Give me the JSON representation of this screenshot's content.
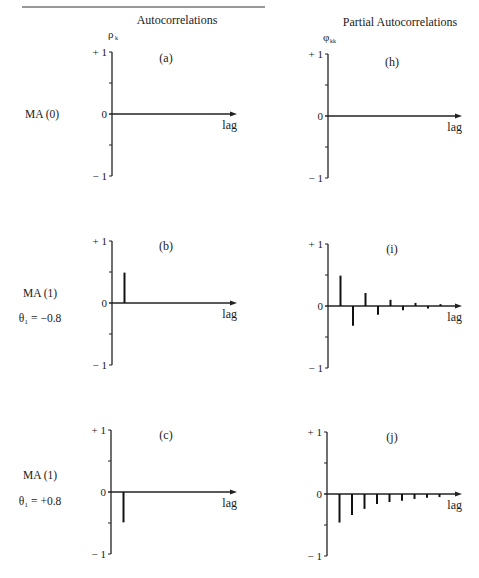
{
  "header": {
    "col_left": "Autocorrelations",
    "col_right": "Partial Autocorrelations",
    "ylabel_left": "ρ",
    "ylabel_left_sub": "k",
    "ylabel_right": "φ",
    "ylabel_right_sub": "kk"
  },
  "rows": [
    {
      "model": "MA (0)",
      "param": ""
    },
    {
      "model": "MA (1)",
      "param": "θ₁ = −0.8"
    },
    {
      "model": "MA (1)",
      "param": "θ₁ = +0.8"
    }
  ],
  "axis": {
    "top": "+ 1",
    "zero": "0",
    "bottom": "− 1",
    "xlabel": "lag"
  },
  "chart_data": [
    {
      "type": "bar",
      "panel": "(a)",
      "title": "Autocorrelations MA(0)",
      "xlabel": "lag",
      "ylabel": "ρk",
      "ylim": [
        -1,
        1
      ],
      "lags": [],
      "values": []
    },
    {
      "type": "bar",
      "panel": "(h)",
      "title": "Partial Autocorrelations MA(0)",
      "xlabel": "lag",
      "ylabel": "φkk",
      "ylim": [
        -1,
        1
      ],
      "lags": [],
      "values": []
    },
    {
      "type": "bar",
      "panel": "(b)",
      "title": "Autocorrelations MA(1), θ1 = −0.8",
      "xlabel": "lag",
      "ylabel": "ρk",
      "ylim": [
        -1,
        1
      ],
      "lags": [
        1
      ],
      "values": [
        0.49
      ]
    },
    {
      "type": "bar",
      "panel": "(i)",
      "title": "Partial Autocorrelations MA(1), θ1 = −0.8",
      "xlabel": "lag",
      "ylabel": "φkk",
      "ylim": [
        -1,
        1
      ],
      "lags": [
        1,
        2,
        3,
        4,
        5,
        6,
        7,
        8,
        9
      ],
      "values": [
        0.49,
        -0.32,
        0.21,
        -0.14,
        0.1,
        -0.07,
        0.05,
        -0.04,
        0.03
      ]
    },
    {
      "type": "bar",
      "panel": "(c)",
      "title": "Autocorrelations MA(1), θ1 = +0.8",
      "xlabel": "lag",
      "ylabel": "ρk",
      "ylim": [
        -1,
        1
      ],
      "lags": [
        1
      ],
      "values": [
        -0.49
      ]
    },
    {
      "type": "bar",
      "panel": "(j)",
      "title": "Partial Autocorrelations MA(1), θ1 = +0.8",
      "xlabel": "lag",
      "ylabel": "φkk",
      "ylim": [
        -1,
        1
      ],
      "lags": [
        1,
        2,
        3,
        4,
        5,
        6,
        7,
        8,
        9
      ],
      "values": [
        -0.46,
        -0.34,
        -0.24,
        -0.16,
        -0.13,
        -0.11,
        -0.08,
        -0.06,
        -0.05
      ]
    }
  ],
  "layout": {
    "panels": [
      {
        "ax": 112,
        "y0": 114,
        "scale": 62,
        "xend": 237,
        "lx": 166,
        "ly": 62
      },
      {
        "ax": 328,
        "y0": 116,
        "scale": 62,
        "xend": 462,
        "lx": 392,
        "ly": 66
      },
      {
        "ax": 112,
        "y0": 303,
        "scale": 62,
        "xend": 237,
        "lx": 166,
        "ly": 250
      },
      {
        "ax": 328,
        "y0": 306,
        "scale": 62,
        "xend": 462,
        "lx": 392,
        "ly": 253
      },
      {
        "ax": 111,
        "y0": 492,
        "scale": 62,
        "xend": 237,
        "lx": 166,
        "ly": 439
      },
      {
        "ax": 327,
        "y0": 494,
        "scale": 62,
        "xend": 462,
        "lx": 392,
        "ly": 441
      }
    ],
    "lag_step": 12.5,
    "row_label_y": [
      118,
      297,
      479
    ],
    "param_y": [
      0,
      322,
      505
    ]
  }
}
